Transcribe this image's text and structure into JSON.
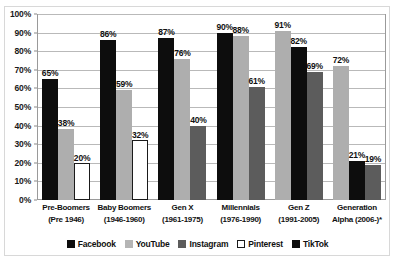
{
  "chart_data": {
    "type": "bar",
    "title": "",
    "xlabel": "",
    "ylabel": "",
    "ylim": [
      0,
      100
    ],
    "ytick_labels": [
      "100%",
      "90%",
      "80%",
      "70%",
      "60%",
      "50%",
      "40%",
      "30%",
      "20%",
      "10%",
      "0%"
    ],
    "ytick_values": [
      100,
      90,
      80,
      70,
      60,
      50,
      40,
      30,
      20,
      10,
      0
    ],
    "grid": true,
    "legend_position": "bottom",
    "categories": [
      "Pre-Boomers (Pre 1946)",
      "Baby Boomers (1946-1960)",
      "Gen X (1961-1975)",
      "Millennials (1976-1990)",
      "Gen Z (1991-2005)",
      "Generation Alpha (2006-)*"
    ],
    "category_lines": [
      [
        "Pre-Boomers",
        "(Pre 1946)"
      ],
      [
        "Baby Boomers",
        "(1946-1960)"
      ],
      [
        "Gen X",
        "(1961-1975)"
      ],
      [
        "Millennials",
        "(1976-1990)"
      ],
      [
        "Gen Z",
        "(1991-2005)"
      ],
      [
        "Generation",
        "Alpha (2006-)*"
      ]
    ],
    "series": [
      {
        "name": "Facebook",
        "values": [
          65,
          86,
          87,
          90,
          82,
          21
        ]
      },
      {
        "name": "YouTube",
        "values": [
          38,
          59,
          76,
          88,
          91,
          72
        ]
      },
      {
        "name": "Instagram",
        "values": [
          null,
          null,
          40,
          61,
          69,
          19
        ]
      },
      {
        "name": "Pinterest",
        "values": [
          20,
          32,
          null,
          null,
          null,
          null
        ]
      },
      {
        "name": "TikTok",
        "values": [
          null,
          null,
          null,
          null,
          null,
          null
        ]
      }
    ],
    "groups": [
      {
        "category": "Pre-Boomers (Pre 1946)",
        "bars": [
          {
            "series": "Facebook",
            "value": 65,
            "label": "65%"
          },
          {
            "series": "YouTube",
            "value": 38,
            "label": "38%"
          },
          {
            "series": "Pinterest",
            "value": 20,
            "label": "20%"
          }
        ]
      },
      {
        "category": "Baby Boomers (1946-1960)",
        "bars": [
          {
            "series": "Facebook",
            "value": 86,
            "label": "86%"
          },
          {
            "series": "YouTube",
            "value": 59,
            "label": "59%"
          },
          {
            "series": "Pinterest",
            "value": 32,
            "label": "32%"
          }
        ]
      },
      {
        "category": "Gen X (1961-1975)",
        "bars": [
          {
            "series": "Facebook",
            "value": 87,
            "label": "87%"
          },
          {
            "series": "YouTube",
            "value": 76,
            "label": "76%"
          },
          {
            "series": "Instagram",
            "value": 40,
            "label": "40%"
          }
        ]
      },
      {
        "category": "Millennials (1976-1990)",
        "bars": [
          {
            "series": "Facebook",
            "value": 90,
            "label": "90%"
          },
          {
            "series": "YouTube",
            "value": 88,
            "label": "88%"
          },
          {
            "series": "Instagram",
            "value": 61,
            "label": "61%"
          }
        ]
      },
      {
        "category": "Gen Z (1991-2005)",
        "bars": [
          {
            "series": "YouTube",
            "value": 91,
            "label": "91%"
          },
          {
            "series": "Facebook",
            "value": 82,
            "label": "82%"
          },
          {
            "series": "Instagram",
            "value": 69,
            "label": "69%"
          }
        ]
      },
      {
        "category": "Generation Alpha (2006-)*",
        "bars": [
          {
            "series": "YouTube",
            "value": 72,
            "label": "72%"
          },
          {
            "series": "Facebook",
            "value": 21,
            "label": "21%"
          },
          {
            "series": "Instagram",
            "value": 19,
            "label": "19%"
          }
        ]
      }
    ],
    "legend": [
      {
        "label": "Facebook",
        "key": "facebook",
        "color": "#0d0d0d"
      },
      {
        "label": "YouTube",
        "key": "youtube",
        "color": "#b5b5b5"
      },
      {
        "label": "Instagram",
        "key": "instagram",
        "color": "#5c5c5c"
      },
      {
        "label": "Pinterest",
        "key": "pinterest",
        "color": "#ffffff"
      },
      {
        "label": "TikTok",
        "key": "tiktok",
        "color": "#0d0d0d"
      }
    ],
    "colors": {
      "facebook": "#0d0d0d",
      "youtube": "#b5b5b5",
      "instagram": "#5c5c5c",
      "pinterest": "#ffffff",
      "tiktok": "#0d0d0d",
      "gridline": "#b9b9b9",
      "axis": "#9a9a9a",
      "text": "#111111",
      "background": "#ffffff"
    }
  }
}
